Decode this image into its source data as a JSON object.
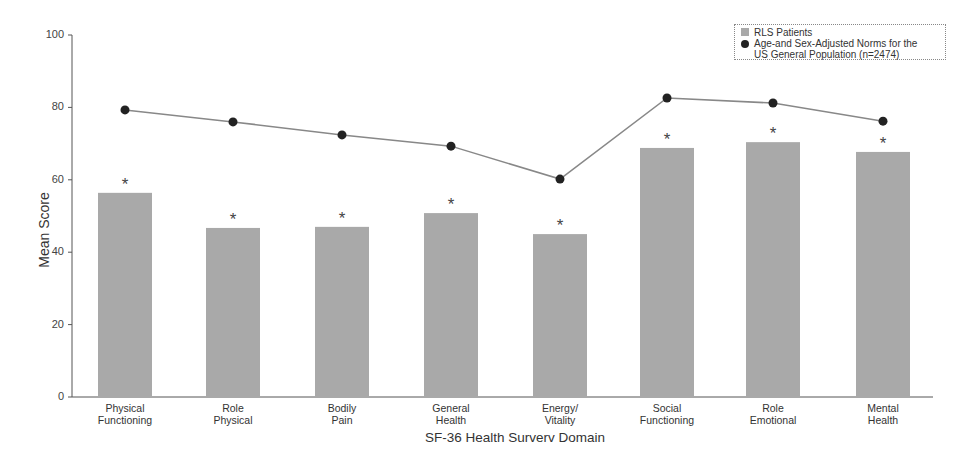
{
  "chart_data": {
    "type": "bar",
    "title": "",
    "xlabel": "SF-36 Health Surverv Domain",
    "ylabel": "Mean Score",
    "ylim": [
      0,
      100
    ],
    "yticks": [
      0,
      20,
      40,
      60,
      80,
      100
    ],
    "grid": false,
    "legend_position": "top-right",
    "categories": [
      "Physical Functioning",
      "Role Physical",
      "Bodily Pain",
      "General Health",
      "Energy/ Vitality",
      "Social Functioning",
      "Role Emotional",
      "Mental Health"
    ],
    "category_lines": [
      [
        "Physical",
        "Functioning"
      ],
      [
        "Role",
        "Physical"
      ],
      [
        "Bodily",
        "Pain"
      ],
      [
        "General",
        "Health"
      ],
      [
        "Energy/",
        "Vitality"
      ],
      [
        "Social",
        "Functioning"
      ],
      [
        "Role",
        "Emotional"
      ],
      [
        "Mental",
        "Health"
      ]
    ],
    "series": [
      {
        "name": "RLS Patients",
        "type": "bar",
        "color": "#a9a9a9",
        "values": [
          56.4,
          46.7,
          47.0,
          50.8,
          45.0,
          68.8,
          70.4,
          67.7
        ],
        "annotations": [
          "*",
          "*",
          "*",
          "*",
          "*",
          "*",
          "*",
          "*"
        ]
      },
      {
        "name": "Age-and Sex-Adjusted Norms for the US General Population (n=2474)",
        "type": "line",
        "color": "#222222",
        "values": [
          79.3,
          76.0,
          72.4,
          69.3,
          60.2,
          82.6,
          81.2,
          76.2
        ]
      }
    ]
  },
  "legend": {
    "bar_label": "RLS Patients",
    "line_label_1": "Age-and Sex-Adjusted Norms for the",
    "line_label_2": "US General Population (n=2474)"
  },
  "axes": {
    "ylabel": "Mean Score",
    "xlabel": "SF-36 Health Surverv Domain"
  }
}
